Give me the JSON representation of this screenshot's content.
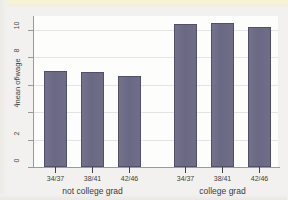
{
  "figure": {
    "background_color": "#f2f1ef",
    "plot_background_color": "#fdfdfb",
    "bar_color": "#6d6c86",
    "bar_edge_color": "#50506a",
    "axis_color": "#9a9a9a",
    "grid_color": "#e4e4e6"
  },
  "chart_data": {
    "type": "bar",
    "title": "",
    "xlabel": "",
    "ylabel": "mean of wage",
    "ylim": [
      0,
      11
    ],
    "yticks": [
      0,
      2,
      4,
      6,
      8,
      10
    ],
    "ytick_labels": [
      "0",
      "2",
      "4",
      "6",
      "8",
      "10"
    ],
    "grid": true,
    "grid_axis": "y",
    "legend": false,
    "group_labels": [
      "not college grad",
      "college grad"
    ],
    "categories": [
      "34/37",
      "38/41",
      "42/46"
    ],
    "series": [
      {
        "name": "not college grad",
        "categories": [
          "34/37",
          "38/41",
          "42/46"
        ],
        "values": [
          7.0,
          6.9,
          6.6
        ]
      },
      {
        "name": "college grad",
        "categories": [
          "34/37",
          "38/41",
          "42/46"
        ],
        "values": [
          10.4,
          10.5,
          10.2
        ]
      }
    ],
    "bars": [
      {
        "group": "not college grad",
        "category": "34/37",
        "value": 7.0
      },
      {
        "group": "not college grad",
        "category": "38/41",
        "value": 6.9
      },
      {
        "group": "not college grad",
        "category": "42/46",
        "value": 6.6
      },
      {
        "group": "college grad",
        "category": "34/37",
        "value": 10.4
      },
      {
        "group": "college grad",
        "category": "38/41",
        "value": 10.5
      },
      {
        "group": "college grad",
        "category": "42/46",
        "value": 10.2
      }
    ]
  }
}
